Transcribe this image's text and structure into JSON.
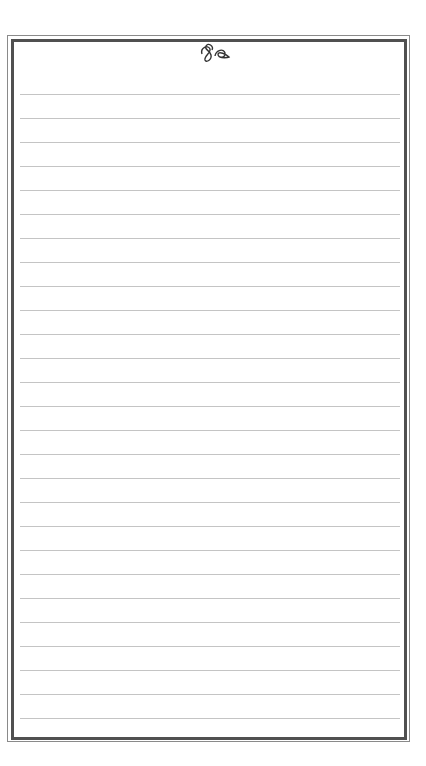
{
  "page": {
    "type": "lined-notepaper",
    "ornament": "script-flourish",
    "colors": {
      "background": "#ffffff",
      "border_dark": "#505050",
      "border_light": "#8a8a8a",
      "rule": "#c4c4c4"
    },
    "rules": {
      "count": 27,
      "first_y": 94,
      "spacing": 24
    }
  }
}
